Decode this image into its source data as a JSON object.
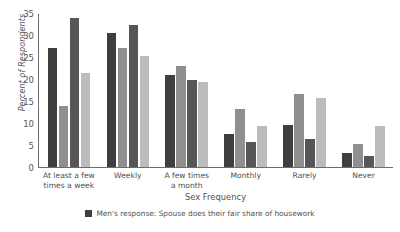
{
  "chart_data": {
    "type": "bar",
    "title": "",
    "xlabel": "Sex Frequency",
    "ylabel": "Percent of Respondents",
    "ylim": [
      0,
      35
    ],
    "yticks": [
      0,
      5,
      10,
      15,
      20,
      25,
      30,
      35
    ],
    "grid": false,
    "legend_position": "bottom",
    "categories": [
      "At least a few times a week",
      "Weekly",
      "A few times a month",
      "Monthly",
      "Rarely",
      "Never"
    ],
    "category_lines": [
      [
        "At least a few",
        "times a week"
      ],
      [
        "Weekly"
      ],
      [
        "A few times",
        "a month"
      ],
      [
        "Monthly"
      ],
      [
        "Rarely"
      ],
      [
        "Never"
      ]
    ],
    "series": [
      {
        "name": "Men's response: Spouse does their fair share of housework",
        "color": "#3f3f3f",
        "values": [
          27.3,
          30.7,
          21.0,
          7.5,
          9.5,
          3.2
        ]
      },
      {
        "name": "Men's response: Spouse does not do their fair share of housework",
        "color": "#8f8f8f",
        "values": [
          13.8,
          27.2,
          23.0,
          13.3,
          16.7,
          5.2
        ]
      },
      {
        "name": "Women's response: Spouse does their fair share of housework",
        "color": "#565656",
        "values": [
          34.0,
          32.4,
          19.8,
          5.7,
          6.3,
          2.5
        ]
      },
      {
        "name": "Women's response: Spouse does not do their fair share of housework",
        "color": "#bcbcbc",
        "values": [
          21.4,
          25.3,
          19.3,
          9.4,
          15.8,
          9.3
        ]
      }
    ],
    "legend_visible_entries": [
      {
        "label": "Men's response: Spouse does their fair share of housework",
        "color": "#3f3f3f"
      }
    ]
  }
}
